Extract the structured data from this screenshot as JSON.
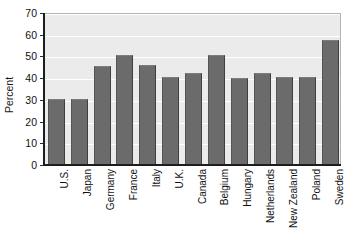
{
  "chart_data": {
    "type": "bar",
    "title": "",
    "xlabel": "",
    "ylabel": "Percent",
    "ylim": [
      0,
      70
    ],
    "ytick_step": 10,
    "yticks": [
      0,
      10,
      20,
      30,
      40,
      50,
      60,
      70
    ],
    "grid": true,
    "legend": false,
    "categories": [
      "U.S.",
      "Japan",
      "Germany",
      "France",
      "Italy",
      "U.K.",
      "Canada",
      "Belgium",
      "Hungary",
      "Netherlands",
      "New Zealand",
      "Poland",
      "Sweden"
    ],
    "values": [
      30,
      30,
      45,
      50,
      45.5,
      40,
      42,
      50,
      39.5,
      42,
      40,
      40,
      57
    ],
    "colors": {
      "bar_fill": "#6b6b6b",
      "bar_edge": "#3f3f3f",
      "plot_background": "#ebebeb",
      "gridline": "#ffffff",
      "axis": "#1d1d1d",
      "text": "#111111"
    }
  }
}
